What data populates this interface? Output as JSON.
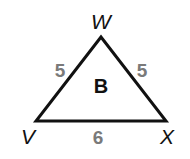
{
  "figure": {
    "name": "B",
    "vertices": [
      {
        "label": "W",
        "x": 101,
        "y": 37
      },
      {
        "label": "V",
        "x": 36,
        "y": 121
      },
      {
        "label": "X",
        "x": 166,
        "y": 121
      }
    ],
    "sides": [
      {
        "between": "V-W",
        "length": "5"
      },
      {
        "between": "W-X",
        "length": "5"
      },
      {
        "between": "V-X",
        "length": "6"
      }
    ],
    "colors": {
      "stroke": "#111111",
      "side_label": "#7a7a7a",
      "vertex_label": "#111111"
    }
  }
}
